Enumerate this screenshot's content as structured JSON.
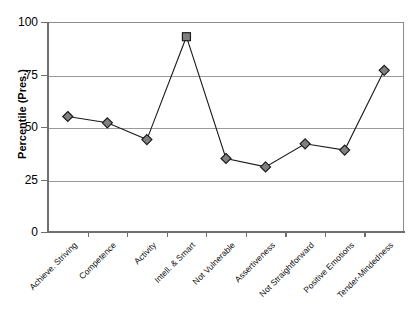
{
  "chart_data": {
    "type": "line",
    "title": "",
    "xlabel": "",
    "ylabel": "Percentile (Pres.)",
    "ylim": [
      0,
      100
    ],
    "yticks": [
      0,
      25,
      50,
      75,
      100
    ],
    "grid": true,
    "legend": "none",
    "categories": [
      "Achieve. Striving",
      "Competence",
      "Activity",
      "Intell. & Smart",
      "Not Vulnerable",
      "Assertiveness",
      "Not Straightforward",
      "Positive Emotions",
      "Tender-Mindedness"
    ],
    "values": [
      55,
      52,
      44,
      93,
      35,
      31,
      42,
      39,
      77
    ],
    "markers": [
      "diamond",
      "diamond",
      "diamond",
      "square",
      "diamond",
      "diamond",
      "diamond",
      "diamond",
      "diamond"
    ],
    "colors": {
      "marker_fill": "#808080",
      "marker_outline": "#1c1c1c",
      "line": "#1a1a1a",
      "gridline": "#9a9a9a",
      "axis": "#6e6e6e"
    }
  },
  "axis": {
    "y_tick_labels": [
      "0",
      "25",
      "50",
      "75",
      "100"
    ],
    "y_title": "Percentile (Pres.)"
  }
}
